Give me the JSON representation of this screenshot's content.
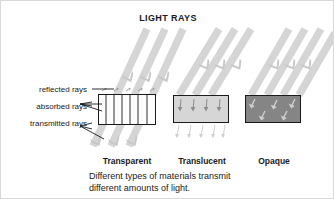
{
  "figure": {
    "title": "LIGHT RAYS",
    "background_color": "#ffffff",
    "ray_color": "#d5d5d5",
    "text_color": "#1a1a1a"
  },
  "side_labels": [
    {
      "id": "reflected",
      "text": "reflected rays"
    },
    {
      "id": "absorbed",
      "text": "absorbed rays"
    },
    {
      "id": "transmitted",
      "text": "transmitted rays"
    }
  ],
  "materials": [
    {
      "id": "transparent",
      "label": "Transparent",
      "fill_color": "#fdfdfd",
      "border_color": "#1a1a1a"
    },
    {
      "id": "translucent",
      "label": "Translucent",
      "fill_color": "#d6d6d6",
      "border_color": "#1a1a1a"
    },
    {
      "id": "opaque",
      "label": "Opaque",
      "fill_color": "#858585",
      "border_color": "#1a1a1a"
    }
  ],
  "caption": {
    "line1": "Different types of materials transmit",
    "line2": "different amounts of light."
  }
}
